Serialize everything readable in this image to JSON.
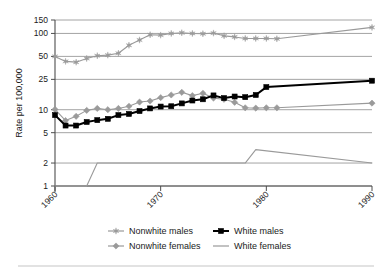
{
  "chart_data": {
    "type": "line",
    "title": "",
    "xlabel": "",
    "ylabel": "Rate per 100,000",
    "yscale": "log",
    "ylim": [
      1,
      150
    ],
    "xlim": [
      1960,
      1990
    ],
    "grid": true,
    "legend_position": "bottom",
    "ytick_labels": [
      "150",
      "100",
      "50",
      "25",
      "10",
      "5",
      "2",
      "1"
    ],
    "ytick_values": [
      150,
      100,
      50,
      25,
      10,
      5,
      2,
      1
    ],
    "xtick_labels": [
      "1960",
      "1970",
      "1980",
      "1990"
    ],
    "xtick_values": [
      1960,
      1970,
      1980,
      1990
    ],
    "series": [
      {
        "name": "Nonwhite males",
        "color": "#9a9a9a",
        "marker": "star",
        "x": [
          1960,
          1961,
          1962,
          1963,
          1964,
          1965,
          1966,
          1967,
          1968,
          1969,
          1970,
          1971,
          1972,
          1973,
          1974,
          1975,
          1976,
          1977,
          1978,
          1979,
          1980,
          1981,
          1990
        ],
        "values": [
          50,
          43,
          42,
          47,
          51,
          52,
          55,
          70,
          82,
          96,
          95,
          100,
          102,
          100,
          99,
          101,
          93,
          90,
          86,
          86,
          86,
          85,
          120
        ]
      },
      {
        "name": "Nonwhite females",
        "color": "#9a9a9a",
        "marker": "diamond",
        "x": [
          1960,
          1961,
          1962,
          1963,
          1964,
          1965,
          1966,
          1967,
          1968,
          1969,
          1970,
          1971,
          1972,
          1973,
          1974,
          1975,
          1976,
          1977,
          1978,
          1979,
          1980,
          1981,
          1990
        ],
        "values": [
          10.1,
          7.2,
          8.2,
          9.8,
          10.4,
          10.0,
          10.4,
          11.1,
          12.6,
          13.0,
          14.4,
          15.6,
          16.9,
          15.3,
          16.4,
          14.2,
          13.7,
          12.5,
          10.6,
          10.5,
          10.6,
          10.6,
          12.2
        ]
      },
      {
        "name": "White males",
        "color": "#000000",
        "marker": "square",
        "x": [
          1960,
          1961,
          1962,
          1963,
          1964,
          1965,
          1966,
          1967,
          1968,
          1969,
          1970,
          1971,
          1972,
          1973,
          1974,
          1975,
          1976,
          1977,
          1978,
          1979,
          1980,
          1990
        ],
        "values": [
          8.5,
          6.2,
          6.2,
          6.9,
          7.3,
          7.6,
          8.5,
          8.8,
          9.6,
          10.4,
          11.0,
          11.1,
          12.1,
          13.2,
          13.7,
          15.4,
          14.2,
          14.9,
          14.6,
          15.6,
          19.8,
          24.0
        ]
      },
      {
        "name": "White females",
        "color": "#9a9a9a",
        "marker": "none",
        "x": [
          1960,
          1963,
          1964,
          1978,
          1979,
          1990
        ],
        "values": [
          1.0,
          1.0,
          2.0,
          2.0,
          3.0,
          2.0
        ]
      }
    ],
    "legend": [
      {
        "label": "Nonwhite males",
        "color": "#9a9a9a",
        "marker": "star"
      },
      {
        "label": "White males",
        "color": "#000000",
        "marker": "square"
      },
      {
        "label": "Nonwhite females",
        "color": "#9a9a9a",
        "marker": "diamond"
      },
      {
        "label": "White females",
        "color": "#9a9a9a",
        "marker": "none"
      }
    ]
  }
}
